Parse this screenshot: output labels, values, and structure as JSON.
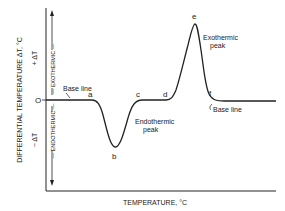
{
  "diagram": {
    "y_axis_label": "DIFFERENTIAL TEMPERATURE ΔT, °C",
    "x_axis_label": "TEMPERATURE, °C",
    "plus_label": "+ ΔT",
    "minus_label": "− ΔT",
    "zero_label": "O",
    "exothermic_label": "— EXOTHERMIC —",
    "endothermic_label": "— ENDOTHERMIC —",
    "baseline_left_label": "Base line",
    "baseline_right_label": "Base line",
    "endothermic_peak_label_1": "Endothermic",
    "endothermic_peak_label_2": "peak",
    "exothermic_peak_label_1": "Exothermic",
    "exothermic_peak_label_2": "peak",
    "points": {
      "a": "a",
      "b": "b",
      "c": "c",
      "d": "d",
      "e": "e",
      "f": "f"
    },
    "line_color": "#222222",
    "background": "#ffffff"
  }
}
